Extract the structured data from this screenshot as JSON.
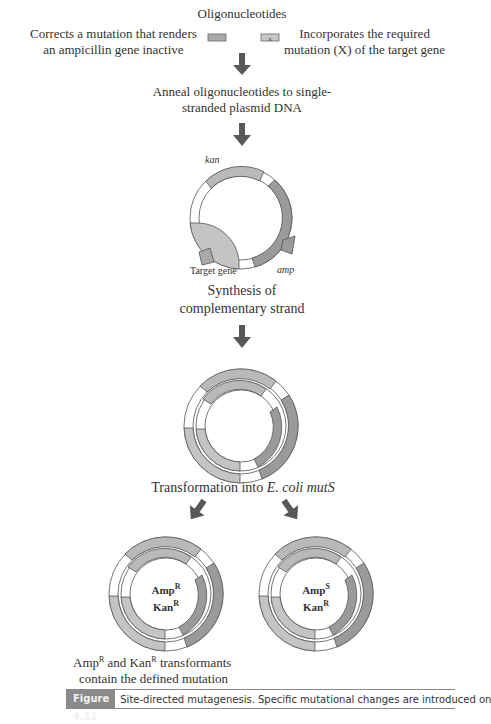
{
  "title": "Oligonucleotides",
  "oligo_left_label": [
    "Corrects a mutation that renders",
    "an ampicillin gene inactive"
  ],
  "oligo_right_label": [
    "Incorporates the required",
    "mutation (X) of the target gene"
  ],
  "oligo_mark": "X",
  "step1": [
    "Anneal oligonucleotides to single-",
    "stranded plasmid DNA"
  ],
  "plasmid_labels": {
    "kan": "kan",
    "amp": "amp",
    "target": "Target gene"
  },
  "step2": [
    "Synthesis of",
    "complementary strand"
  ],
  "step3": {
    "prefix": "Transformation into ",
    "italic": "E. coli mutS"
  },
  "left_plasmid": {
    "line1": "Amp",
    "line1_sup": "R",
    "line2": "Kan",
    "line2_sup": "R"
  },
  "right_plasmid": {
    "line1": "Amp",
    "line1_sup": "S",
    "line2": "Kan",
    "line2_sup": "R"
  },
  "result": {
    "a": "Amp",
    "a_sup": "R",
    "mid": " and Kan",
    "b_sup": "R",
    "end": " transformants",
    "line2": "contain the defined mutation"
  },
  "figure": {
    "label": "Figure 4.11",
    "text": "Site-directed mutagenesis. Specific mutational changes are introduced on"
  },
  "colors": {
    "gene_gray": "#b9b9b9",
    "amp_dark": "#8f8f8f",
    "arrow": "#595959",
    "outline": "#555555"
  }
}
